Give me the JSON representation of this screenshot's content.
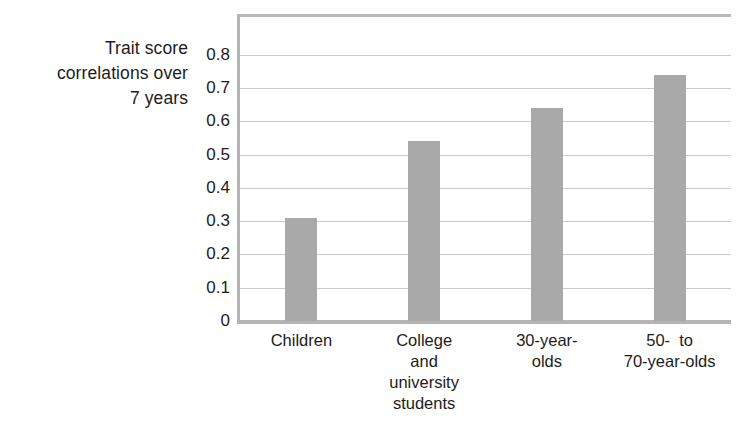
{
  "chart_data": {
    "type": "bar",
    "title": "",
    "subtitle": "",
    "xlabel": "",
    "ylabel": "Trait score correlations over 7 years",
    "ylabel_lines": [
      "Trait score",
      "correlations over",
      "7 years"
    ],
    "categories": [
      "Children",
      "College and university students",
      "30-year-olds",
      "50- to 70-year-olds"
    ],
    "category_lines": [
      [
        "Children"
      ],
      [
        "College",
        "and",
        "university",
        "students"
      ],
      [
        "30-year-",
        "olds"
      ],
      [
        "50-  to",
        "70-year-olds"
      ]
    ],
    "values": [
      0.31,
      0.54,
      0.64,
      0.74
    ],
    "ylim": [
      0,
      0.89
    ],
    "yticks": [
      0.8,
      0.7,
      0.6,
      0.5,
      0.4,
      0.3,
      0.2,
      0.1,
      0
    ],
    "ytick_labels": [
      "0.8",
      "0.7",
      "0.6",
      "0.5",
      "0.4",
      "0.3",
      "0.2",
      "0.1",
      "0"
    ],
    "grid": true,
    "grid_axis": "y",
    "legend": null,
    "legend_position": "none",
    "colors": {
      "bar": "#a9a9a9",
      "gridline": "#c9c9c9",
      "axis": "#b4b4b4",
      "text": "#1c1c1c",
      "background": "#ffffff"
    }
  }
}
